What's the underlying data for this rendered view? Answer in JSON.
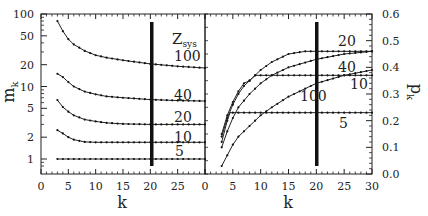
{
  "chart_data": [
    {
      "type": "line",
      "panel": "left",
      "title": "",
      "xlabel": "k",
      "ylabel": "m_k",
      "yscale": "log",
      "xlim": [
        0,
        30
      ],
      "ylim": [
        0.7,
        100
      ],
      "x_ticks": [
        "0",
        "5",
        "10",
        "15",
        "20",
        "25",
        "0"
      ],
      "y_ticks": [
        "1",
        "2",
        "5",
        "10",
        "20",
        "50",
        "100"
      ],
      "legend_title": "Z_sys",
      "annotations": [
        {
          "type": "vertical_line",
          "x": 20,
          "note": "thick vertical bar"
        }
      ],
      "series": [
        {
          "name": "100",
          "x": [
            3,
            4,
            5,
            6,
            8,
            10,
            12,
            15,
            20,
            25,
            30
          ],
          "values": [
            80,
            58,
            45,
            38,
            31,
            27,
            25,
            23,
            20.5,
            19,
            18
          ]
        },
        {
          "name": "40",
          "x": [
            3,
            4,
            5,
            6,
            8,
            10,
            12,
            15,
            20,
            25,
            30
          ],
          "values": [
            15,
            13.5,
            11.5,
            10,
            8.5,
            7.8,
            7.3,
            7.0,
            6.6,
            6.4,
            6.3
          ]
        },
        {
          "name": "20",
          "x": [
            3,
            4,
            5,
            6,
            8,
            10,
            12,
            15,
            20,
            25,
            30
          ],
          "values": [
            6.5,
            5.2,
            4.5,
            4.0,
            3.5,
            3.3,
            3.15,
            3.05,
            3.0,
            3.0,
            3.0
          ]
        },
        {
          "name": "10",
          "x": [
            3,
            4,
            5,
            6,
            8,
            10,
            12,
            15,
            20,
            25,
            30
          ],
          "values": [
            2.5,
            2.25,
            2.0,
            1.85,
            1.72,
            1.7,
            1.7,
            1.7,
            1.7,
            1.7,
            1.7
          ]
        },
        {
          "name": "5",
          "x": [
            3,
            30
          ],
          "values": [
            1.0,
            1.0
          ]
        }
      ]
    },
    {
      "type": "line",
      "panel": "right",
      "title": "",
      "xlabel": "k",
      "ylabel": "p_k",
      "yscale": "linear",
      "xlim": [
        0,
        30
      ],
      "ylim": [
        0.0,
        0.6
      ],
      "x_ticks": [
        "0",
        "5",
        "10",
        "15",
        "20",
        "25",
        "30"
      ],
      "y_ticks": [
        "0.0",
        "0.1",
        "0.2",
        "0.3",
        "0.4",
        "0.5",
        "0.6"
      ],
      "annotations": [
        {
          "type": "vertical_line",
          "x": 20,
          "note": "thick vertical bar"
        }
      ],
      "series": [
        {
          "name": "20",
          "x": [
            3,
            4,
            5,
            6,
            7,
            8,
            10,
            12,
            15,
            18,
            20,
            25,
            30
          ],
          "values": [
            0.15,
            0.22,
            0.27,
            0.31,
            0.34,
            0.35,
            0.39,
            0.42,
            0.45,
            0.46,
            0.46,
            0.46,
            0.46
          ]
        },
        {
          "name": "40",
          "x": [
            3,
            4,
            5,
            6,
            8,
            10,
            12,
            15,
            20,
            25,
            30
          ],
          "values": [
            0.1,
            0.16,
            0.21,
            0.25,
            0.3,
            0.34,
            0.37,
            0.4,
            0.43,
            0.45,
            0.46
          ]
        },
        {
          "name": "10",
          "x": [
            3,
            4,
            5,
            6,
            7,
            8,
            9,
            10,
            15,
            20,
            25,
            30
          ],
          "values": [
            0.14,
            0.21,
            0.26,
            0.3,
            0.33,
            0.35,
            0.37,
            0.37,
            0.37,
            0.37,
            0.37,
            0.37
          ]
        },
        {
          "name": "100",
          "x": [
            3,
            4,
            5,
            6,
            8,
            10,
            12,
            15,
            20,
            25,
            30
          ],
          "values": [
            0.03,
            0.07,
            0.11,
            0.14,
            0.18,
            0.22,
            0.25,
            0.29,
            0.34,
            0.37,
            0.39
          ]
        },
        {
          "name": "5",
          "x": [
            3,
            4,
            4.5,
            30
          ],
          "values": [
            0.12,
            0.2,
            0.23,
            0.23
          ]
        }
      ]
    }
  ],
  "labels": {
    "left_ylabel": "m",
    "left_ylabel_sub": "k",
    "right_ylabel": "p",
    "right_ylabel_sub": "k",
    "xlabel_left": "k",
    "xlabel_right": "k",
    "zsys": "Z",
    "zsys_sub": "sys",
    "left_curve_labels": [
      "100",
      "40",
      "20",
      "10",
      "5"
    ],
    "right_curve_labels": [
      "20",
      "40",
      "10",
      "100",
      "5"
    ]
  }
}
